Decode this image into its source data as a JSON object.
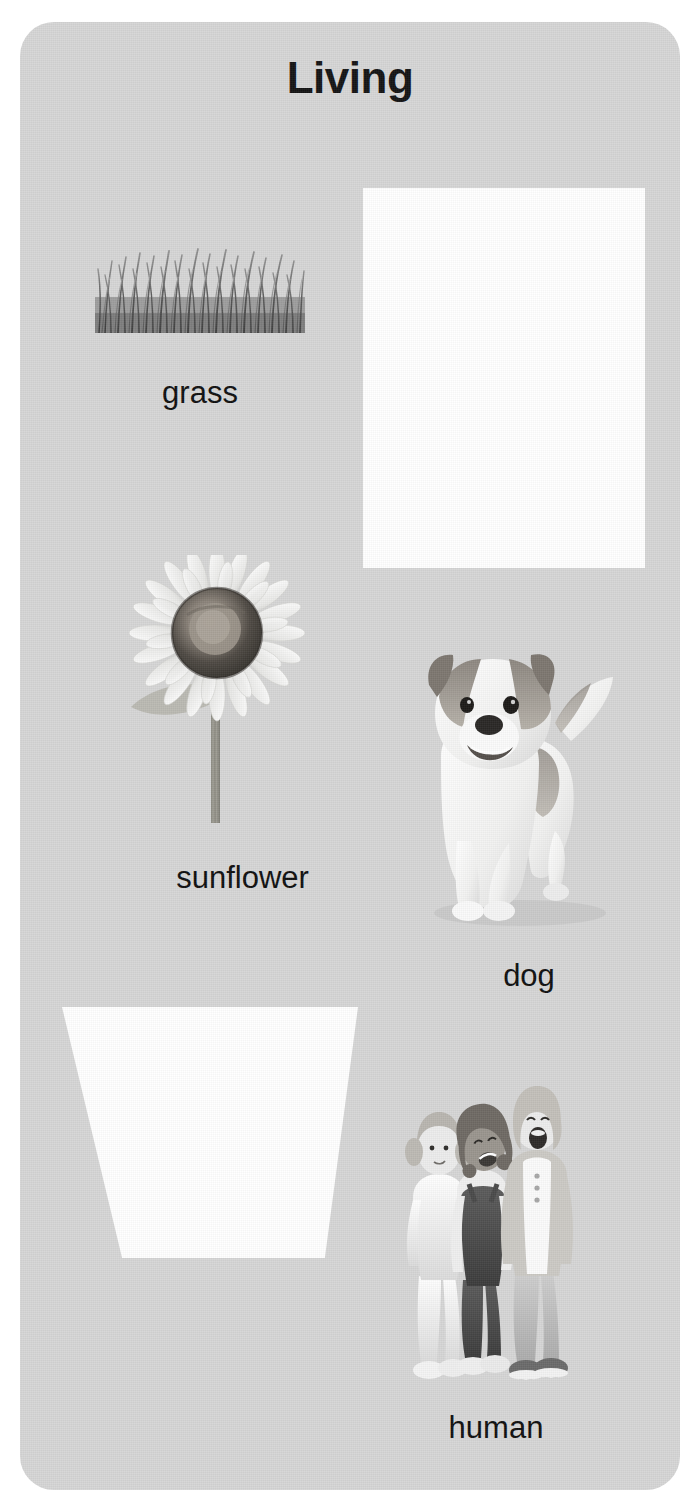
{
  "poster": {
    "title": "Living",
    "background_color": "#d6d6d6",
    "page_background_color": "#ffffff",
    "text_color": "#101010",
    "card_color": "#ffffff"
  },
  "items": [
    {
      "label": "grass",
      "kind": "photo",
      "subject": "tuft-of-grass-blades"
    },
    {
      "label": "",
      "kind": "blank-card",
      "subject": "blank-white-rectangle"
    },
    {
      "label": "sunflower",
      "kind": "photo",
      "subject": "sunflower-with-stem"
    },
    {
      "label": "dog",
      "kind": "photo",
      "subject": "jack-russell-terrier-standing"
    },
    {
      "label": "",
      "kind": "blank-card",
      "subject": "blank-white-trapezoid"
    },
    {
      "label": "human",
      "kind": "photo",
      "subject": "three-children-standing"
    }
  ]
}
